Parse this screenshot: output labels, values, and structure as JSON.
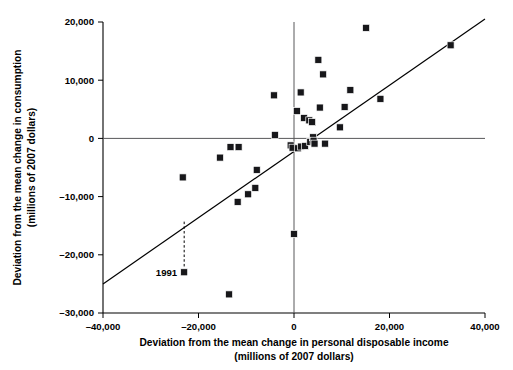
{
  "chart_data": {
    "type": "scatter",
    "title": "",
    "xlabel": "Deviation from the mean change in personal disposable income",
    "xlabel_line2": "(millions of 2007 dollars)",
    "ylabel": "Deviation from the mean change in consumption",
    "ylabel_line2": "(millions of 2007 dollars)",
    "xlim": [
      -40000,
      40000
    ],
    "ylim": [
      -30000,
      20000
    ],
    "grid": false,
    "legend": null,
    "x_ticks": [
      -40000,
      -20000,
      0,
      20000,
      40000
    ],
    "x_tick_labels": [
      "–40,000",
      "–20,000",
      "0",
      "20,000",
      "40,000"
    ],
    "y_ticks": [
      20000,
      10000,
      0,
      -10000,
      -20000,
      -30000
    ],
    "y_tick_labels": [
      "20,000",
      "10,000",
      "0",
      "–10,000",
      "–20,000",
      "–30,000"
    ],
    "marker": "square",
    "marker_color": "#17171a",
    "zero_lines": {
      "x": 0,
      "y": 0,
      "color": "#58585a"
    },
    "fit_line": {
      "x1": -40000,
      "y1": -25000,
      "x2": 40000,
      "y2": 20500,
      "color": "#000000"
    },
    "annotations": [
      {
        "label": "1991",
        "x": -23000,
        "y": -23000,
        "leader_from_x": -23000,
        "leader_from_y": -14300,
        "leader_to_x": -23000,
        "leader_to_y": -22200
      }
    ],
    "points": [
      {
        "x": -23000,
        "y": -23000
      },
      {
        "x": -23300,
        "y": -6700
      },
      {
        "x": -15500,
        "y": -3300
      },
      {
        "x": -13600,
        "y": -26800
      },
      {
        "x": -13300,
        "y": -1500
      },
      {
        "x": -11600,
        "y": -1500
      },
      {
        "x": -11800,
        "y": -10900
      },
      {
        "x": -9600,
        "y": -9600
      },
      {
        "x": -8100,
        "y": -8500
      },
      {
        "x": -7800,
        "y": -5400
      },
      {
        "x": -4200,
        "y": 7400
      },
      {
        "x": -4000,
        "y": 600
      },
      {
        "x": -700,
        "y": -1200
      },
      {
        "x": -300,
        "y": -1600
      },
      {
        "x": 0,
        "y": -16400
      },
      {
        "x": 600,
        "y": 4700
      },
      {
        "x": 800,
        "y": -1700
      },
      {
        "x": 1400,
        "y": 7900
      },
      {
        "x": 1500,
        "y": -1400
      },
      {
        "x": 2100,
        "y": 3500
      },
      {
        "x": 2300,
        "y": -1300
      },
      {
        "x": 3200,
        "y": 3100
      },
      {
        "x": 3400,
        "y": -600
      },
      {
        "x": 3800,
        "y": 2800
      },
      {
        "x": 4000,
        "y": 200
      },
      {
        "x": 4100,
        "y": -400
      },
      {
        "x": 4300,
        "y": -900
      },
      {
        "x": 5100,
        "y": 13500
      },
      {
        "x": 5400,
        "y": 5300
      },
      {
        "x": 6100,
        "y": 11000
      },
      {
        "x": 6500,
        "y": -900
      },
      {
        "x": 9600,
        "y": 1900
      },
      {
        "x": 10600,
        "y": 5400
      },
      {
        "x": 11800,
        "y": 8300
      },
      {
        "x": 15100,
        "y": 19000
      },
      {
        "x": 18100,
        "y": 6800
      },
      {
        "x": 32800,
        "y": 16000
      }
    ]
  }
}
